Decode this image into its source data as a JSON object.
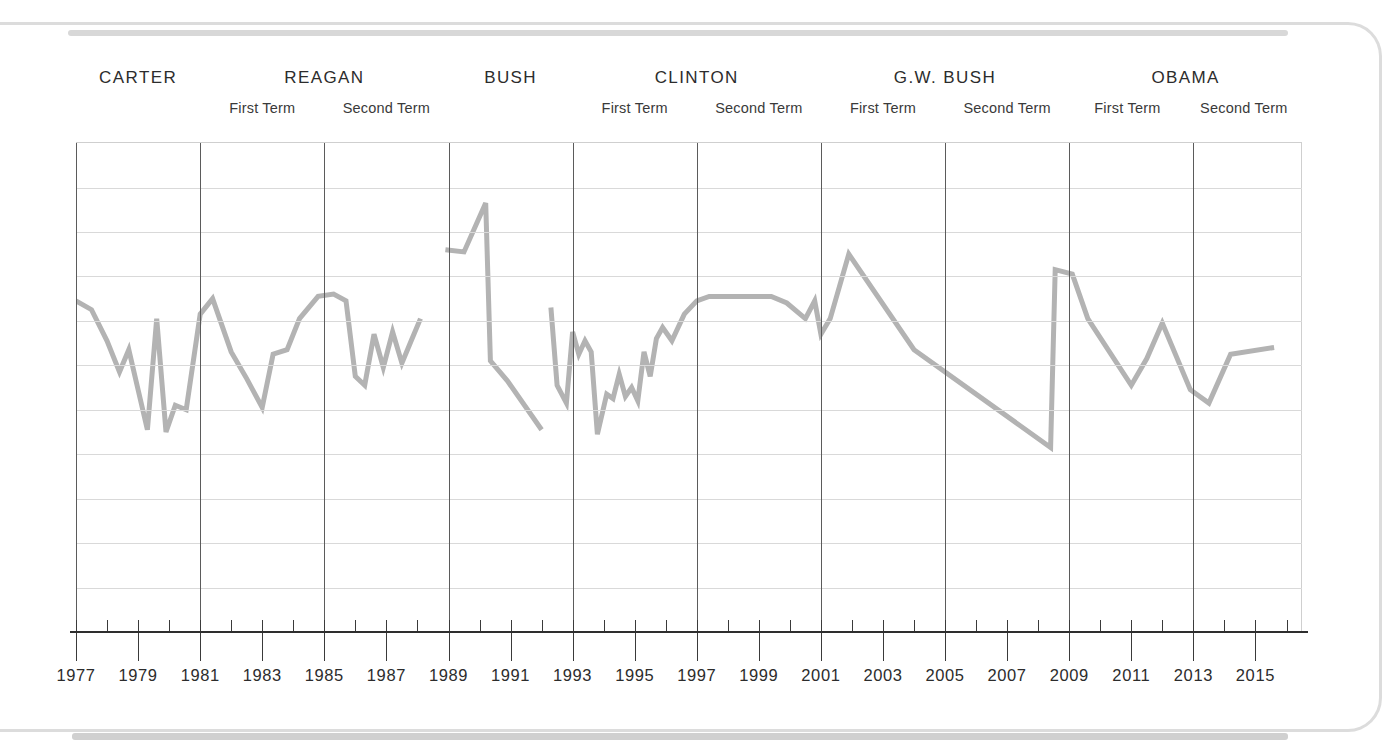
{
  "figure": {
    "frame_style": "rounded-page-border",
    "border_color": "#dcdcdc",
    "background": "#ffffff"
  },
  "presidents": [
    {
      "name": "CARTER",
      "terms": [
        "",
        ""
      ],
      "start_year": 1977,
      "end_year": 1981
    },
    {
      "name": "REAGAN",
      "terms": [
        "First Term",
        "Second Term"
      ],
      "start_year": 1981,
      "end_year": 1989
    },
    {
      "name": "BUSH",
      "terms": [
        "",
        ""
      ],
      "start_year": 1989,
      "end_year": 1993
    },
    {
      "name": "CLINTON",
      "terms": [
        "First Term",
        "Second Term"
      ],
      "start_year": 1993,
      "end_year": 2001
    },
    {
      "name": "G.W. BUSH",
      "terms": [
        "First Term",
        "Second Term"
      ],
      "start_year": 2001,
      "end_year": 2009
    },
    {
      "name": "OBAMA",
      "terms": [
        "First Term",
        "Second Term"
      ],
      "start_year": 2009,
      "end_year": 2017
    }
  ],
  "chart_data": {
    "type": "line",
    "title": "",
    "subtitle": "",
    "xlabel": "",
    "ylabel": "",
    "grid": true,
    "legend_position": "none",
    "line_color": "#b3b3b3",
    "line_width": 5,
    "gridline_color": "#d9d9d9",
    "term_divider_color": "#5b5b5b",
    "xlim": [
      1977,
      2016.5
    ],
    "ylim": [
      0,
      11
    ],
    "y_gridlines": [
      1,
      2,
      3,
      4,
      5,
      6,
      7,
      8,
      9,
      10
    ],
    "x_tick_years": [
      1977,
      1978,
      1979,
      1980,
      1981,
      1982,
      1983,
      1984,
      1985,
      1986,
      1987,
      1988,
      1989,
      1990,
      1991,
      1992,
      1993,
      1994,
      1995,
      1996,
      1997,
      1998,
      1999,
      2000,
      2001,
      2002,
      2003,
      2004,
      2005,
      2006,
      2007,
      2008,
      2009,
      2010,
      2011,
      2012,
      2013,
      2014,
      2015,
      2016
    ],
    "x_tick_labels": [
      "1977",
      "1979",
      "1981",
      "1983",
      "1985",
      "1987",
      "1989",
      "1991",
      "1993",
      "1995",
      "1997",
      "1999",
      "2001",
      "2003",
      "2005",
      "2007",
      "2009",
      "2011",
      "2013",
      "2015"
    ],
    "x_tick_label_years": [
      1977,
      1979,
      1981,
      1983,
      1985,
      1987,
      1989,
      1991,
      1993,
      1995,
      1997,
      1999,
      2001,
      2003,
      2005,
      2007,
      2009,
      2011,
      2013,
      2015
    ],
    "term_divider_years": [
      1977,
      1981,
      1985,
      1989,
      1993,
      1997,
      2001,
      2005,
      2009,
      2013
    ],
    "segments": [
      {
        "name": "carter-through-reagan-1988",
        "points": [
          [
            1977.0,
            7.45
          ],
          [
            1977.5,
            7.25
          ],
          [
            1978.0,
            6.55
          ],
          [
            1978.4,
            5.85
          ],
          [
            1978.7,
            6.35
          ],
          [
            1979.0,
            5.45
          ],
          [
            1979.3,
            4.55
          ],
          [
            1979.6,
            7.05
          ],
          [
            1979.9,
            4.5
          ],
          [
            1980.2,
            5.1
          ],
          [
            1980.55,
            5.0
          ],
          [
            1981.0,
            7.15
          ],
          [
            1981.4,
            7.5
          ],
          [
            1982.0,
            6.3
          ],
          [
            1982.5,
            5.7
          ],
          [
            1983.0,
            5.05
          ],
          [
            1983.35,
            6.25
          ],
          [
            1983.8,
            6.35
          ],
          [
            1984.2,
            7.05
          ],
          [
            1984.8,
            7.55
          ],
          [
            1985.3,
            7.6
          ],
          [
            1985.7,
            7.45
          ],
          [
            1986.0,
            5.75
          ],
          [
            1986.3,
            5.55
          ],
          [
            1986.6,
            6.7
          ],
          [
            1986.9,
            5.95
          ],
          [
            1987.2,
            6.75
          ],
          [
            1987.5,
            6.05
          ],
          [
            1987.8,
            6.55
          ],
          [
            1988.1,
            7.05
          ]
        ]
      },
      {
        "name": "bush-hw-spike",
        "points": [
          [
            1988.9,
            8.6
          ],
          [
            1989.5,
            8.55
          ],
          [
            1990.2,
            9.65
          ],
          [
            1990.35,
            6.1
          ],
          [
            1990.9,
            5.65
          ],
          [
            1992.0,
            4.55
          ]
        ]
      },
      {
        "name": "clinton-through-obama",
        "points": [
          [
            1992.3,
            7.3
          ],
          [
            1992.5,
            5.55
          ],
          [
            1992.8,
            5.15
          ],
          [
            1993.0,
            6.75
          ],
          [
            1993.2,
            6.25
          ],
          [
            1993.4,
            6.55
          ],
          [
            1993.6,
            6.3
          ],
          [
            1993.8,
            4.45
          ],
          [
            1994.1,
            5.35
          ],
          [
            1994.3,
            5.25
          ],
          [
            1994.5,
            5.8
          ],
          [
            1994.7,
            5.3
          ],
          [
            1994.9,
            5.5
          ],
          [
            1995.1,
            5.2
          ],
          [
            1995.3,
            6.3
          ],
          [
            1995.5,
            5.75
          ],
          [
            1995.7,
            6.6
          ],
          [
            1995.9,
            6.85
          ],
          [
            1996.2,
            6.55
          ],
          [
            1996.6,
            7.15
          ],
          [
            1997.0,
            7.45
          ],
          [
            1997.4,
            7.55
          ],
          [
            1999.4,
            7.55
          ],
          [
            1999.9,
            7.4
          ],
          [
            2000.5,
            7.05
          ],
          [
            2000.8,
            7.45
          ],
          [
            2001.0,
            6.7
          ],
          [
            2001.3,
            7.05
          ],
          [
            2001.9,
            8.5
          ],
          [
            2004.0,
            6.35
          ],
          [
            2008.4,
            4.15
          ],
          [
            2008.55,
            8.15
          ],
          [
            2009.1,
            8.05
          ],
          [
            2009.6,
            7.05
          ],
          [
            2011.0,
            5.55
          ],
          [
            2011.5,
            6.15
          ],
          [
            2012.0,
            6.95
          ],
          [
            2012.9,
            5.45
          ],
          [
            2013.5,
            5.15
          ],
          [
            2014.2,
            6.25
          ],
          [
            2015.6,
            6.4
          ]
        ]
      }
    ]
  }
}
